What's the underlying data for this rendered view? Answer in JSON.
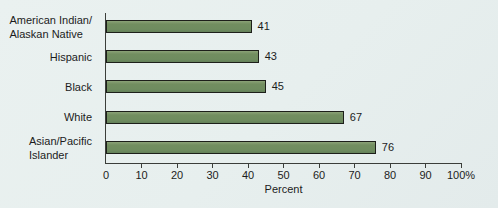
{
  "chart_data": {
    "type": "bar",
    "orientation": "horizontal",
    "categories": [
      "American Indian/Alaskan Native",
      "Hispanic",
      "Black",
      "White",
      "Asian/Pacific Islander"
    ],
    "category_label_lines": [
      [
        "American Indian/",
        "Alaskan Native"
      ],
      [
        "Hispanic"
      ],
      [
        "Black"
      ],
      [
        "White"
      ],
      [
        "Asian/Pacific",
        "Islander"
      ]
    ],
    "values": [
      41,
      43,
      45,
      67,
      76
    ],
    "value_labels": [
      "41",
      "43",
      "45",
      "67",
      "76"
    ],
    "title": "",
    "xlabel": "Percent",
    "ylabel": "",
    "xlim": [
      0,
      100
    ],
    "xticks": [
      0,
      10,
      20,
      30,
      40,
      50,
      60,
      70,
      80,
      90,
      100
    ],
    "xtick_labels": [
      "0",
      "10",
      "20",
      "30",
      "40",
      "50",
      "60",
      "70",
      "80",
      "90",
      "100%"
    ],
    "grid": "off",
    "legend": "none",
    "colors": {
      "bar_fill": "#6f8c5f",
      "bar_border": "#1d1f1a",
      "axis": "#3b3e3a",
      "text": "#1c1c1c",
      "background": "#e8efee"
    }
  }
}
